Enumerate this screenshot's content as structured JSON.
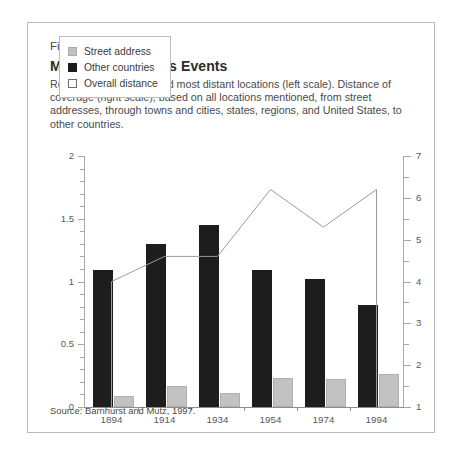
{
  "figure": {
    "number": "Figure 10.1",
    "title": "More Distant News Events",
    "caption": "References to closest and most distant locations (left scale). Distance of coverage (right scale), based on all locations mentioned, from street addresses, through towns and cities, states, regions, and United States, to other countries.",
    "source": "Source: Barnhurst and Mutz, 1997."
  },
  "legend": {
    "items": [
      {
        "label": "Street address",
        "swatch": "gray",
        "color": "#c2c2c2"
      },
      {
        "label": "Other countries",
        "swatch": "black",
        "color": "#1d1d1d"
      },
      {
        "label": "Overall distance",
        "swatch": "white",
        "color": "#ffffff"
      }
    ]
  },
  "axes": {
    "left_ticks": [
      "0",
      "0.5",
      "1",
      "1.5",
      "2"
    ],
    "right_ticks": [
      "1",
      "2",
      "3",
      "4",
      "5",
      "6",
      "7"
    ]
  },
  "chart_data": {
    "type": "bar",
    "title": "More Distant News Events",
    "subtitle": "References to closest and most distant locations (left scale). Distance of coverage (right scale), based on all locations mentioned, from street addresses, through towns and cities, states, regions, and United States, to other countries.",
    "xlabel": "",
    "ylabel": "",
    "categories": [
      "1894",
      "1914",
      "1934",
      "1954",
      "1974",
      "1994"
    ],
    "ylim": [
      0,
      2
    ],
    "y2lim": [
      1,
      7
    ],
    "grid": false,
    "legend_position": "top-left",
    "series": [
      {
        "name": "Street address",
        "type": "bar",
        "axis": "left",
        "color": "#c2c2c2",
        "values": [
          1.09,
          1.3,
          1.45,
          1.09,
          1.02,
          0.81
        ]
      },
      {
        "name": "Other countries",
        "type": "bar",
        "axis": "left",
        "color": "#1d1d1d",
        "values": [
          0.09,
          0.17,
          0.11,
          0.23,
          0.22,
          0.26
        ]
      },
      {
        "name": "Overall distance",
        "type": "line",
        "axis": "right",
        "color": "#9a9a9a",
        "values": [
          4.0,
          4.6,
          4.6,
          6.2,
          5.3,
          6.2
        ]
      }
    ]
  }
}
